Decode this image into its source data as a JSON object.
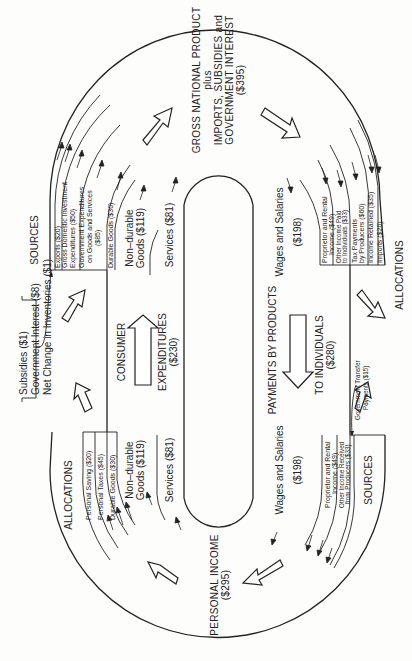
{
  "diagram": {
    "type": "circular-flow",
    "orientation": "rotated 90° counter-clockwise",
    "top_node": {
      "title": "GROSS NATIONAL PRODUCT",
      "line2": "plus",
      "line3": "IMPORTS, SUBSIDIES and",
      "line4": "GOVERNMENT INTEREST",
      "value": "($395)"
    },
    "bottom_node": {
      "title": "PERSONAL INCOME",
      "value": "($295)"
    },
    "left_channel": {
      "line1": "CONSUMER",
      "line2": "EXPENDITURES",
      "value": "($230)",
      "items": {
        "nondurable_top": {
          "line1": "Non–durable",
          "line2": "Goods ($119)"
        },
        "services_top": "Services ($81)",
        "nondurable_bottom": {
          "line1": "Non–durable",
          "line2": "Goods ($119)"
        },
        "services_bottom": "Services ($81)"
      }
    },
    "right_channel": {
      "line1": "PAYMENTS BY PRODUCTS",
      "line2": "TO INDIVIDUALS",
      "value": "($280)",
      "wages_top": {
        "line1": "Wages and Salaries",
        "line2": "($198)"
      },
      "wages_bottom": {
        "line1": "Wages and Salaries",
        "line2": "($198)"
      }
    },
    "gnp_sources": {
      "heading": "SOURCES",
      "items": [
        "Exports ($20)",
        "Gross Domestic Investment",
        "Expenditures ($50)",
        "Government Expenditures",
        "on Goods and Services",
        "($85)",
        "Durable Goods ($30)"
      ]
    },
    "gnp_allocations": {
      "heading": "ALLOCATIONS",
      "items": [
        "Proprietor and Rental",
        "Income ($49)",
        "Other Income Paid",
        "to Individuals ($33)",
        "Tax Payments",
        "by Producers ($60)",
        "Income Retained ($35)",
        "Imports ($20)"
      ]
    },
    "pi_allocations": {
      "heading": "ALLOCATIONS",
      "items": [
        "Personal Saving ($20)",
        "Personal Taxes ($45)",
        "Durable Goods ($30)"
      ]
    },
    "pi_sources": {
      "heading": "SOURCES",
      "items": [
        "Proprietor and Rental",
        "Income ($49)",
        "Other Income Received",
        "from Producers ($33)"
      ],
      "transfer": {
        "line1": "Government Transfer",
        "line2": "Payments ($15)"
      }
    },
    "adjustments": {
      "items": [
        "Subsidies ($1)",
        "Government Interest ($8)",
        "Net Change in Inventories ($1)"
      ]
    }
  }
}
